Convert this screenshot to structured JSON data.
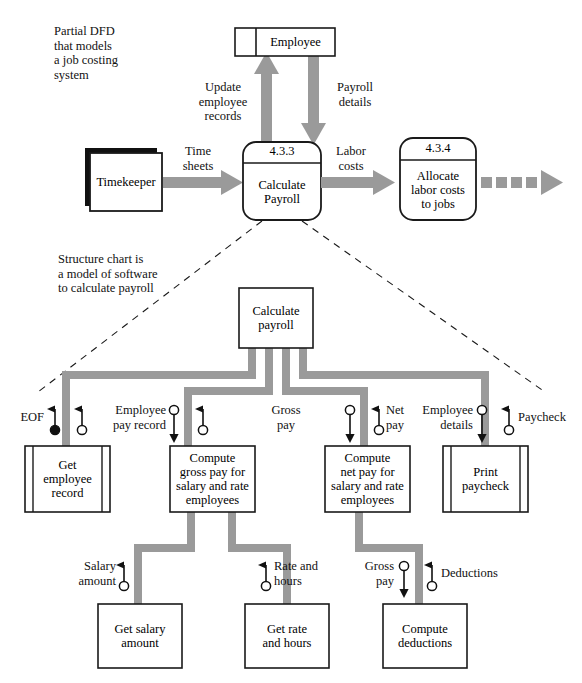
{
  "figure": {
    "type": "diagram",
    "subtype": "data-flow-diagram-and-structure-chart",
    "colors": {
      "flow_gray": "#9a9a9a",
      "line_black": "#1a1a1a",
      "fill_white": "#ffffff",
      "shadow_black": "#000000"
    }
  },
  "annotations": {
    "dfd_note": "Partial DFD\nthat models\na job costing\nsystem",
    "structure_chart_note": "Structure chart is\na model of software\nto calculate payroll"
  },
  "dfd": {
    "datastore": {
      "label": "Employee"
    },
    "external_entity": {
      "label": "Timekeeper"
    },
    "processes": [
      {
        "number": "4.3.3",
        "name": "Calculate\nPayroll"
      },
      {
        "number": "4.3.4",
        "name": "Allocate\nlabor costs\nto jobs"
      }
    ],
    "flows": [
      {
        "label": "Update\nemployee\nrecords",
        "direction": "up"
      },
      {
        "label": "Payroll\ndetails",
        "direction": "down"
      },
      {
        "label": "Time\nsheets",
        "direction": "right"
      },
      {
        "label": "Labor\ncosts",
        "direction": "right"
      },
      {
        "label": "",
        "direction": "right",
        "style": "dashed"
      }
    ]
  },
  "structure_chart": {
    "modules": [
      {
        "id": "root",
        "name": "Calculate\npayroll",
        "kind": "module"
      },
      {
        "id": "get-emp",
        "name": "Get\nemployee\nrecord",
        "kind": "library"
      },
      {
        "id": "gross",
        "name": "Compute\ngross pay for\nsalary and rate\nemployees",
        "kind": "module"
      },
      {
        "id": "net",
        "name": "Compute\nnet pay for\nsalary and rate\nemployees",
        "kind": "module"
      },
      {
        "id": "print",
        "name": "Print\npaycheck",
        "kind": "library"
      },
      {
        "id": "salary",
        "name": "Get salary\namount",
        "kind": "module"
      },
      {
        "id": "rate",
        "name": "Get rate\nand hours",
        "kind": "module"
      },
      {
        "id": "deduct",
        "name": "Compute\ndeductions",
        "kind": "module"
      }
    ],
    "couples": [
      {
        "label": "EOF",
        "type": "control",
        "direction": "up",
        "side": "left"
      },
      {
        "label": "",
        "type": "data",
        "direction": "up",
        "side": "left"
      },
      {
        "label": "Employee\npay record",
        "type": "data",
        "direction": "down",
        "side": "left"
      },
      {
        "label": "",
        "type": "data",
        "direction": "up",
        "side": "right"
      },
      {
        "label": "Gross\npay",
        "type": "data",
        "direction": "down",
        "side": "left"
      },
      {
        "label": "Net\npay",
        "type": "data",
        "direction": "up",
        "side": "right"
      },
      {
        "label": "Employee\ndetails",
        "type": "data",
        "direction": "down",
        "side": "left"
      },
      {
        "label": "Paycheck",
        "type": "data",
        "direction": "up",
        "side": "right"
      },
      {
        "label": "Salary\namount",
        "type": "data",
        "direction": "up",
        "side": "left"
      },
      {
        "label": "Rate and\nhours",
        "type": "data",
        "direction": "up",
        "side": "left"
      },
      {
        "label": "Gross\npay",
        "type": "data",
        "direction": "down",
        "side": "left"
      },
      {
        "label": "Deductions",
        "type": "data",
        "direction": "up",
        "side": "right"
      }
    ]
  }
}
